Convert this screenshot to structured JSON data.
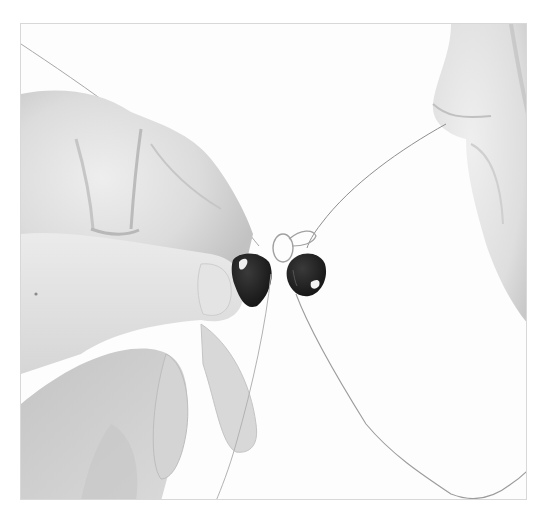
{
  "photo": {
    "description": "Grayscale photo of two hands threading two dark teardrop beads onto a thin wire/thread loop",
    "subjects": [
      "left-hand",
      "right-hand",
      "bead-left",
      "bead-right",
      "thread-loop",
      "threads"
    ],
    "colors": {
      "background": "#fdfdfd",
      "frame_border": "#d8d8d8",
      "skin_light": "#ececec",
      "skin_mid": "#d2d2d2",
      "skin_shadow": "#b4b4b4",
      "bead": "#1e1e1e",
      "bead_highlight": "#f2f2f2",
      "thread": "#9a9a9a"
    }
  }
}
